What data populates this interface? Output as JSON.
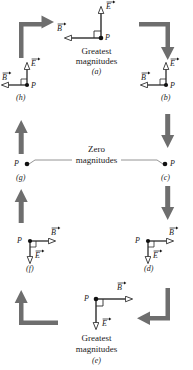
{
  "figure": {
    "title_top": {
      "line1": "Greatest",
      "line2": "magnitudes"
    },
    "title_middle": {
      "line1": "Zero",
      "line2": "magnitudes"
    },
    "title_bottom": {
      "line1": "Greatest",
      "line2": "magnitudes"
    },
    "vector_symbols": {
      "electric": "E",
      "magnetic": "B",
      "point": "P"
    },
    "colors": {
      "ink": "#1a1a1a",
      "connector_arrow": "#6e6e6e",
      "vector_stroke": "#2b2b2b",
      "arrowhead_fill": "#ffffff",
      "thin_line": "#7a7a7a",
      "background": "#ffffff"
    }
  },
  "panels": [
    {
      "id": "a",
      "label": "(a)",
      "position": "top-center",
      "caption_line1": "Greatest",
      "caption_line2": "magnitudes",
      "magnitude": "greatest",
      "E": {
        "symbol": "E",
        "direction": "up",
        "length": "long"
      },
      "B": {
        "symbol": "B",
        "direction": "left",
        "length": "long"
      },
      "P": "P",
      "right_angle_marker": true
    },
    {
      "id": "b",
      "label": "(b)",
      "position": "right-upper",
      "caption_line1": "",
      "caption_line2": "",
      "magnitude": "intermediate",
      "E": {
        "symbol": "E",
        "direction": "up",
        "length": "short"
      },
      "B": {
        "symbol": "B",
        "direction": "left",
        "length": "short"
      },
      "P": "P",
      "right_angle_marker": true
    },
    {
      "id": "c",
      "label": "(c)",
      "position": "right-middle",
      "caption_line1": "Zero",
      "caption_line2": "magnitudes",
      "magnitude": "zero",
      "E": {
        "symbol": "E",
        "direction": "none",
        "length": "zero"
      },
      "B": {
        "symbol": "B",
        "direction": "none",
        "length": "zero"
      },
      "P": "P",
      "right_angle_marker": false
    },
    {
      "id": "d",
      "label": "(d)",
      "position": "right-lower",
      "caption_line1": "",
      "caption_line2": "",
      "magnitude": "intermediate",
      "E": {
        "symbol": "E",
        "direction": "down",
        "length": "short"
      },
      "B": {
        "symbol": "B",
        "direction": "right",
        "length": "short"
      },
      "P": "P",
      "right_angle_marker": true
    },
    {
      "id": "e",
      "label": "(e)",
      "position": "bottom-center",
      "caption_line1": "Greatest",
      "caption_line2": "magnitudes",
      "magnitude": "greatest",
      "E": {
        "symbol": "E",
        "direction": "down",
        "length": "long"
      },
      "B": {
        "symbol": "B",
        "direction": "right",
        "length": "long"
      },
      "P": "P",
      "right_angle_marker": true
    },
    {
      "id": "f",
      "label": "(f)",
      "position": "left-lower",
      "caption_line1": "",
      "caption_line2": "",
      "magnitude": "intermediate",
      "E": {
        "symbol": "E",
        "direction": "down",
        "length": "short"
      },
      "B": {
        "symbol": "B",
        "direction": "right",
        "length": "short"
      },
      "P": "P",
      "right_angle_marker": true
    },
    {
      "id": "g",
      "label": "(g)",
      "position": "left-middle",
      "caption_line1": "Zero",
      "caption_line2": "magnitudes",
      "magnitude": "zero",
      "E": {
        "symbol": "E",
        "direction": "none",
        "length": "zero"
      },
      "B": {
        "symbol": "B",
        "direction": "none",
        "length": "zero"
      },
      "P": "P",
      "right_angle_marker": false
    },
    {
      "id": "h",
      "label": "(h)",
      "position": "left-upper",
      "caption_line1": "",
      "caption_line2": "",
      "magnitude": "intermediate",
      "E": {
        "symbol": "E",
        "direction": "up",
        "length": "short"
      },
      "B": {
        "symbol": "B",
        "direction": "left",
        "length": "short"
      },
      "P": "P",
      "right_angle_marker": true
    }
  ],
  "connectors": [
    {
      "name": "corner-top-left",
      "from": "h",
      "to": "a",
      "shape": "elbow-up-right",
      "head": "right"
    },
    {
      "name": "corner-top-right",
      "from": "a",
      "to": "b",
      "shape": "elbow-right-down",
      "head": "down"
    },
    {
      "name": "straight-right-upper",
      "from": "b",
      "to": "c",
      "shape": "straight-vertical",
      "head": "down"
    },
    {
      "name": "straight-right-lower",
      "from": "c",
      "to": "d",
      "shape": "straight-vertical",
      "head": "down"
    },
    {
      "name": "corner-bottom-right",
      "from": "d",
      "to": "e",
      "shape": "elbow-down-left",
      "head": "left"
    },
    {
      "name": "corner-bottom-left",
      "from": "e",
      "to": "f",
      "shape": "elbow-left-up",
      "head": "up"
    },
    {
      "name": "straight-left-lower",
      "from": "f",
      "to": "g",
      "shape": "straight-vertical",
      "head": "up"
    },
    {
      "name": "straight-left-upper",
      "from": "g",
      "to": "h",
      "shape": "straight-vertical",
      "head": "up"
    }
  ]
}
